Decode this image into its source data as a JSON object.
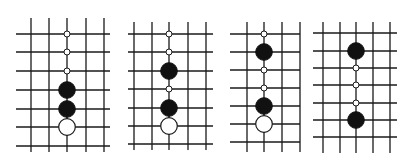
{
  "colors": {
    "line": "#1a1a1a",
    "black_stone": "#111111",
    "white_stone": "#ffffff",
    "background": "#ffffff"
  },
  "diagrams": [
    {
      "id": "diagram-1",
      "vlines": [
        31,
        49,
        67,
        86,
        104
      ],
      "hlines": [
        34,
        52,
        71,
        90,
        109,
        127,
        146
      ],
      "vspan": [
        18,
        152
      ],
      "hspan": [
        16,
        110
      ],
      "stone_col": 2,
      "points": [
        {
          "row": 0,
          "type": "marker"
        },
        {
          "row": 1,
          "type": "marker"
        },
        {
          "row": 2,
          "type": "marker"
        },
        {
          "row": 3,
          "type": "black"
        },
        {
          "row": 4,
          "type": "black"
        },
        {
          "row": 5,
          "type": "white"
        }
      ]
    },
    {
      "id": "diagram-2",
      "vlines": [
        134,
        152,
        169,
        188,
        206
      ],
      "hlines": [
        34,
        52,
        71,
        89,
        108,
        126,
        144
      ],
      "vspan": [
        22,
        150
      ],
      "hspan": [
        128,
        213
      ],
      "stone_col": 2,
      "points": [
        {
          "row": 0,
          "type": "marker"
        },
        {
          "row": 1,
          "type": "marker"
        },
        {
          "row": 2,
          "type": "black"
        },
        {
          "row": 3,
          "type": "marker"
        },
        {
          "row": 4,
          "type": "black"
        },
        {
          "row": 5,
          "type": "white"
        }
      ]
    },
    {
      "id": "diagram-3",
      "vlines": [
        247,
        264,
        282,
        300
      ],
      "hlines": [
        34,
        52,
        70,
        88,
        106,
        124,
        142
      ],
      "vspan": [
        22,
        152
      ],
      "hspan": [
        230,
        300
      ],
      "stone_col": 1,
      "points": [
        {
          "row": 0,
          "type": "marker"
        },
        {
          "row": 1,
          "type": "black"
        },
        {
          "row": 2,
          "type": "marker"
        },
        {
          "row": 3,
          "type": "marker"
        },
        {
          "row": 4,
          "type": "black"
        },
        {
          "row": 5,
          "type": "white"
        }
      ]
    },
    {
      "id": "diagram-4",
      "vlines": [
        323,
        340,
        356,
        373,
        390
      ],
      "hlines": [
        33,
        51,
        68,
        85,
        103,
        120,
        137
      ],
      "vspan": [
        22,
        153
      ],
      "hspan": [
        313,
        397
      ],
      "stone_col": 2,
      "points": [
        {
          "row": 1,
          "type": "black"
        },
        {
          "row": 2,
          "type": "marker"
        },
        {
          "row": 3,
          "type": "marker"
        },
        {
          "row": 4,
          "type": "marker"
        },
        {
          "row": 5,
          "type": "black"
        }
      ]
    }
  ]
}
